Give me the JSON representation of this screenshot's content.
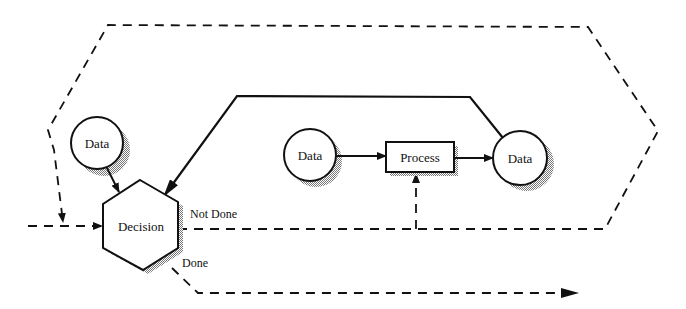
{
  "diagram": {
    "nodes": {
      "data_left": {
        "label": "Data",
        "shape": "circle"
      },
      "data_middle": {
        "label": "Data",
        "shape": "circle"
      },
      "data_right": {
        "label": "Data",
        "shape": "circle"
      },
      "process": {
        "label": "Process",
        "shape": "rectangle"
      },
      "decision": {
        "label": "Decision",
        "shape": "hexagon"
      }
    },
    "edge_labels": {
      "not_done": "Not Done",
      "done": "Done"
    },
    "colors": {
      "stroke": "#111111",
      "shadow": "#9a9a9a",
      "background": "#ffffff"
    }
  }
}
